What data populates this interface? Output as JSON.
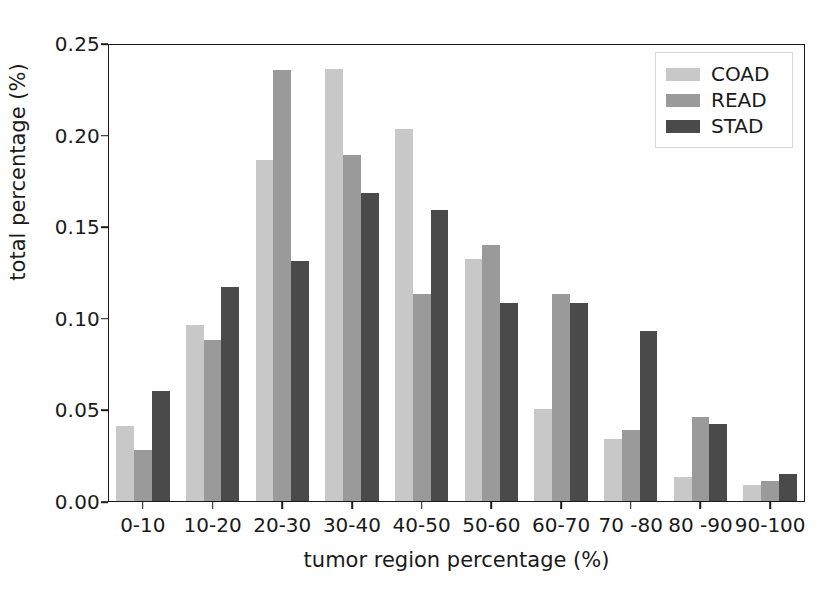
{
  "chart_data": {
    "type": "bar",
    "title": "",
    "xlabel": "tumor region percentage (%)",
    "ylabel": "total percentage (%)",
    "categories": [
      "0-10",
      "10-20",
      "20-30",
      "30-40",
      "40-50",
      "50-60",
      "60-70",
      "70 -80",
      "80 -90",
      "90-100"
    ],
    "series": [
      {
        "name": "COAD",
        "color": "#c8c8c8",
        "values": [
          0.041,
          0.096,
          0.186,
          0.236,
          0.203,
          0.132,
          0.05,
          0.034,
          0.013,
          0.009
        ]
      },
      {
        "name": "READ",
        "color": "#9a9a9a",
        "values": [
          0.028,
          0.088,
          0.235,
          0.189,
          0.113,
          0.14,
          0.113,
          0.039,
          0.046,
          0.011
        ]
      },
      {
        "name": "STAD",
        "color": "#4a4a4a",
        "values": [
          0.06,
          0.117,
          0.131,
          0.168,
          0.159,
          0.108,
          0.108,
          0.093,
          0.042,
          0.015
        ]
      }
    ],
    "yticks": [
      "0.00",
      "0.05",
      "0.10",
      "0.15",
      "0.20",
      "0.25"
    ],
    "ytick_values": [
      0.0,
      0.05,
      0.1,
      0.15,
      0.2,
      0.25
    ],
    "ylim": [
      0.0,
      0.25
    ],
    "grid": false,
    "legend_position": "upper right",
    "legend_entries": [
      "COAD",
      "READ",
      "STAD"
    ]
  },
  "axis_color": "#1a1a1a",
  "background": "#ffffff"
}
